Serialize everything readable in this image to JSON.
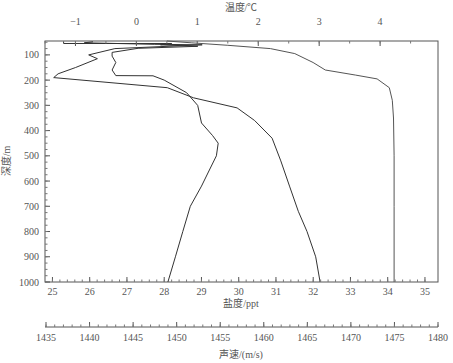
{
  "chart_data": {
    "type": "line",
    "title": "",
    "orientation": "depth profile (y inverted)",
    "axes": {
      "depth": {
        "label": "深度/m",
        "position": "left",
        "range": [
          45,
          1000
        ],
        "ticks": [
          100,
          200,
          300,
          400,
          500,
          600,
          700,
          800,
          900,
          1000
        ]
      },
      "temperature": {
        "label": "温度/℃",
        "position": "top",
        "range": [
          -1.5,
          4.95
        ],
        "ticks": [
          -1,
          0,
          1,
          2,
          3,
          4
        ]
      },
      "salinity": {
        "label": "盐度/ppt",
        "position": "bottom",
        "range": [
          24.8,
          35.35
        ],
        "ticks": [
          25,
          26,
          27,
          28,
          29,
          30,
          31,
          32,
          33,
          34,
          35
        ]
      },
      "sound_speed": {
        "label": "声速/(m/s)",
        "position": "bottom-secondary",
        "range": [
          1435,
          1480
        ],
        "ticks": [
          1435,
          1440,
          1445,
          1450,
          1455,
          1460,
          1465,
          1470,
          1475,
          1480
        ]
      }
    },
    "grid": false,
    "legend": null,
    "series": [
      {
        "name": "温度",
        "axis": "temperature",
        "color": "#555555",
        "points": [
          [
            0.5,
            45
          ],
          [
            0.9,
            52
          ],
          [
            1.5,
            62
          ],
          [
            2.2,
            75
          ],
          [
            2.6,
            95
          ],
          [
            2.9,
            130
          ],
          [
            3.1,
            160
          ],
          [
            3.6,
            180
          ],
          [
            3.95,
            195
          ],
          [
            4.15,
            230
          ],
          [
            4.2,
            280
          ],
          [
            4.22,
            350
          ],
          [
            4.23,
            500
          ],
          [
            4.23,
            700
          ],
          [
            4.23,
            1000
          ]
        ]
      },
      {
        "name": "盐度",
        "axis": "salinity",
        "color": "#333333",
        "points": [
          [
            25.3,
            47
          ],
          [
            25.3,
            55
          ],
          [
            28.2,
            55
          ],
          [
            27.9,
            60
          ],
          [
            28.9,
            66
          ],
          [
            27.3,
            74
          ],
          [
            26.6,
            90
          ],
          [
            26.6,
            105
          ],
          [
            26.7,
            130
          ],
          [
            26.6,
            160
          ],
          [
            26.7,
            182
          ],
          [
            27.7,
            183
          ],
          [
            28.0,
            200
          ],
          [
            28.6,
            250
          ],
          [
            28.9,
            300
          ],
          [
            29.0,
            370
          ],
          [
            29.3,
            420
          ],
          [
            29.45,
            450
          ],
          [
            29.4,
            500
          ],
          [
            29.2,
            560
          ],
          [
            29.0,
            620
          ],
          [
            28.7,
            700
          ],
          [
            28.5,
            800
          ],
          [
            28.3,
            900
          ],
          [
            28.1,
            1000
          ]
        ]
      },
      {
        "name": "声速",
        "axis": "sound_speed",
        "color": "#333333",
        "points": [
          [
            1440.5,
            48
          ],
          [
            1439.5,
            52
          ],
          [
            1447.5,
            58
          ],
          [
            1453,
            60
          ],
          [
            1443,
            75
          ],
          [
            1440,
            100
          ],
          [
            1441,
            115
          ],
          [
            1438.5,
            150
          ],
          [
            1436.5,
            175
          ],
          [
            1436,
            190
          ],
          [
            1449,
            230
          ],
          [
            1452,
            270
          ],
          [
            1457,
            310
          ],
          [
            1459,
            360
          ],
          [
            1461,
            430
          ],
          [
            1462,
            520
          ],
          [
            1463,
            620
          ],
          [
            1464,
            720
          ],
          [
            1465,
            800
          ],
          [
            1466,
            900
          ],
          [
            1466.5,
            1000
          ]
        ]
      }
    ]
  },
  "labels": {
    "temperature_title": "温度/℃",
    "depth_title": "深度/m",
    "salinity_title": "盐度/ppt",
    "sound_speed_title": "声速/(m/s)"
  }
}
